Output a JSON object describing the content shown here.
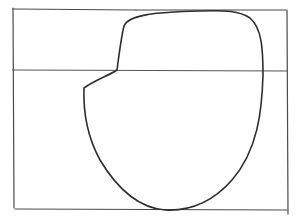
{
  "sketch": {
    "description": "Pencil line drawing: rectangle frame divided by a horizontal line, with a rounded blob shape overlapping",
    "stroke_color": "#3a3a3a",
    "frame_color": "#4a4a4a",
    "background": "#ffffff"
  }
}
